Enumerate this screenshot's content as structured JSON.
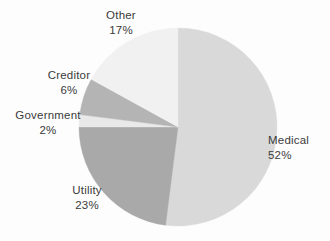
{
  "chart_data": {
    "type": "pie",
    "title": "",
    "subtitle": "",
    "xlabel": "",
    "ylabel": "",
    "legend": "none",
    "grid": false,
    "value_suffix": "%",
    "start_angle_deg": 0,
    "direction": "clockwise",
    "categories": [
      "Medical",
      "Utility",
      "Government",
      "Creditor",
      "Other"
    ],
    "values": [
      52,
      23,
      2,
      6,
      17
    ],
    "colors": [
      "#d9d9d9",
      "#a9a9a9",
      "#e9e9e9",
      "#b4b4b4",
      "#f1f1f1"
    ],
    "slices": [
      {
        "label": "Medical",
        "value": 52,
        "value_text": "52%",
        "color": "#d9d9d9"
      },
      {
        "label": "Utility",
        "value": 23,
        "value_text": "23%",
        "color": "#a9a9a9"
      },
      {
        "label": "Government",
        "value": 2,
        "value_text": "2%",
        "color": "#e9e9e9"
      },
      {
        "label": "Creditor",
        "value": 6,
        "value_text": "6%",
        "color": "#b4b4b4"
      },
      {
        "label": "Other",
        "value": 17,
        "value_text": "17%",
        "color": "#f1f1f1"
      }
    ]
  },
  "labels": {
    "other": {
      "name": "Other",
      "pct": "17%"
    },
    "creditor": {
      "name": "Creditor",
      "pct": "6%"
    },
    "government": {
      "name": "Government",
      "pct": "2%"
    },
    "utility": {
      "name": "Utility",
      "pct": "23%"
    },
    "medical": {
      "name": "Medical",
      "pct": "52%"
    }
  },
  "geometry": {
    "center_x": 178,
    "center_y": 127,
    "radius": 99
  }
}
